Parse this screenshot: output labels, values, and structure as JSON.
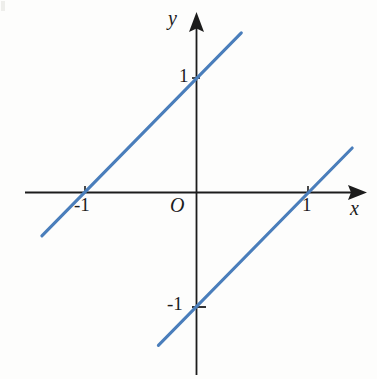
{
  "figure": {
    "kind": "cartesian-line-graph",
    "background_color": "#fdfdfc",
    "axis_color": "#1c1c1c",
    "line_color": "#4a7ebb"
  },
  "axes": {
    "x_axis_label": "x",
    "y_axis_label": "y",
    "origin_label": "O",
    "x_ticks": [
      {
        "value": -1,
        "label": "-1"
      },
      {
        "value": 1,
        "label": "1"
      }
    ],
    "y_ticks": [
      {
        "value": 1,
        "label": "1"
      },
      {
        "value": -1,
        "label": "-1"
      }
    ]
  },
  "chart_data": {
    "type": "line",
    "title": "",
    "xlabel": "x",
    "ylabel": "y",
    "xlim": [
      -1.53,
      1.53
    ],
    "ylim": [
      -1.6,
      1.34
    ],
    "grid": false,
    "legend": "none",
    "axis_origin_label": "O",
    "xticks": [
      -1,
      1
    ],
    "xticklabels": [
      "-1",
      "1"
    ],
    "yticks": [
      -1,
      1
    ],
    "yticklabels": [
      "1",
      "-1"
    ],
    "series": [
      {
        "name": "y = x + 1",
        "slope": 1,
        "intercept": 1,
        "color": "#4a7ebb",
        "x": [
          -1.38,
          0.4
        ],
        "y": [
          -0.38,
          1.4
        ],
        "x_intercept": -1,
        "y_intercept": 1
      },
      {
        "name": "y = x - 1",
        "slope": 1,
        "intercept": -1,
        "color": "#4a7ebb",
        "x": [
          -0.34,
          1.39
        ],
        "y": [
          -1.34,
          0.39
        ],
        "x_intercept": 1,
        "y_intercept": -1
      }
    ]
  }
}
